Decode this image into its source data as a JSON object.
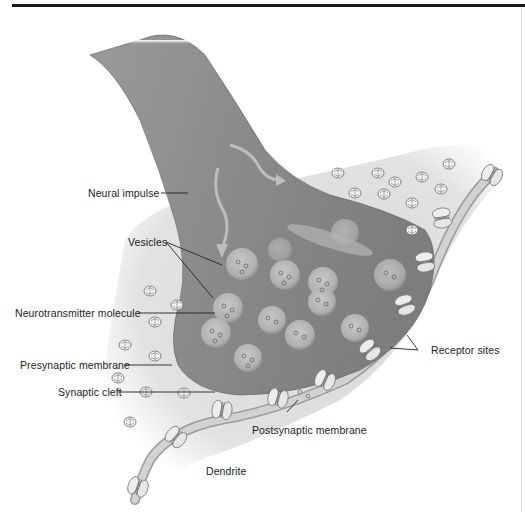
{
  "figure": {
    "type": "labeled-illustration",
    "labels": {
      "neural_impulse": "Neural impulse",
      "vesicles": "Vesicles",
      "neurotransmitter_molecule": "Neurotransmitter molecule",
      "presynaptic_membrane": "Presynaptic membrane",
      "synaptic_cleft": "Synaptic cleft",
      "receptor_sites": "Receptor sites",
      "postsynaptic_membrane": "Postsynaptic membrane",
      "dendrite": "Dendrite"
    },
    "colors": {
      "axon": "#8e8e8e",
      "axon_highlight": "#b4b4b4",
      "cleft_fill": "#dcdcdc",
      "membrane": "#bdbdbd",
      "receptor": "#ececec",
      "text": "#222222",
      "rule": "#1a1a1a"
    }
  }
}
